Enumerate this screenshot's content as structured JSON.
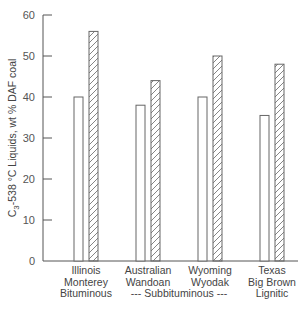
{
  "chart_data": {
    "type": "bar",
    "title": "",
    "xlabel": "",
    "ylabel": "C3-538 °C Liquids, wt % DAF coal",
    "ylabel_parts": {
      "c": "C",
      "sub": "3",
      "rest": "-538 °C Liquids, wt % DAF coal"
    },
    "ylim": [
      0,
      60
    ],
    "yticks": [
      0,
      10,
      20,
      30,
      40,
      50,
      60
    ],
    "grid": false,
    "legend": "none",
    "categories": [
      {
        "line1": "Illinois",
        "line2": "Monterey"
      },
      {
        "line1": "Australian",
        "line2": "Wandoan"
      },
      {
        "line1": "Wyoming",
        "line2": "Wyodak"
      },
      {
        "line1": "Texas",
        "line2": "Big Brown"
      }
    ],
    "series": [
      {
        "name": "open bar",
        "style": "open",
        "values": [
          40,
          38,
          40,
          35.5
        ]
      },
      {
        "name": "hatched bar",
        "style": "hatched",
        "values": [
          56,
          44,
          50,
          48
        ]
      }
    ],
    "rank_labels": {
      "bituminous": "Bituminous",
      "subbituminous": "--- Subbituminous ---",
      "lignitic": "Lignitic"
    }
  },
  "colors": {
    "axis": "#555555",
    "bar_stroke": "#666666",
    "hatch": "#777777",
    "background": "#ffffff"
  }
}
